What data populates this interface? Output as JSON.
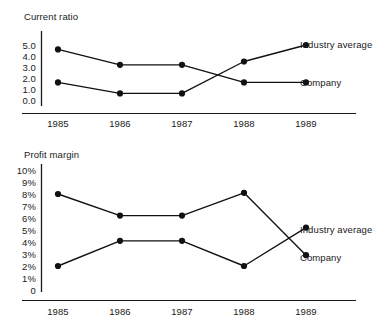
{
  "chart_data": [
    {
      "type": "line",
      "title": "Current ratio",
      "xlabel": "",
      "ylabel": "",
      "categories": [
        "1985",
        "1986",
        "1987",
        "1988",
        "1989"
      ],
      "yticks": [
        "5.0",
        "4.0",
        "3.0",
        "2.0",
        "1.0",
        "0.0"
      ],
      "ylim": [
        0,
        5.6
      ],
      "grid": false,
      "legend_position": "right-inline",
      "series": [
        {
          "name": "Industry average",
          "values": [
            1.6,
            0.6,
            0.6,
            3.5,
            5.0
          ],
          "end_label": "Industry average"
        },
        {
          "name": "Company",
          "values": [
            4.6,
            3.2,
            3.2,
            1.6,
            1.6
          ],
          "end_label": "Company"
        }
      ],
      "annotations": [
        "Series cross between 1987 and 1988"
      ]
    },
    {
      "type": "line",
      "title": "Profit margin",
      "xlabel": "",
      "ylabel": "",
      "categories": [
        "1985",
        "1986",
        "1987",
        "1988",
        "1989"
      ],
      "yticks": [
        "10%",
        "9%",
        "8%",
        "7%",
        "6%",
        "5%",
        "4%",
        "3%",
        "2%",
        "1%",
        "0"
      ],
      "ylim": [
        0,
        10
      ],
      "grid": false,
      "legend_position": "right-inline",
      "series": [
        {
          "name": "Industry average",
          "values": [
            2.0,
            4.1,
            4.1,
            2.0,
            5.2
          ],
          "end_label": "Industry average"
        },
        {
          "name": "Company",
          "values": [
            8.0,
            6.2,
            6.2,
            8.1,
            2.9
          ],
          "end_label": "Company"
        }
      ],
      "annotations": [
        "Series cross between 1988 and 1989"
      ]
    }
  ],
  "charts": {
    "current_ratio": {
      "title": "Current ratio",
      "yticks": [
        "5.0",
        "4.0",
        "3.0",
        "2.0",
        "1.0",
        "0.0"
      ],
      "xticks": [
        "1985",
        "1986",
        "1987",
        "1988",
        "1989"
      ],
      "labels": {
        "industry": "Industry average",
        "company": "Company"
      }
    },
    "profit_margin": {
      "title": "Profit margin",
      "yticks": [
        "10%",
        "9%",
        "8%",
        "7%",
        "6%",
        "5%",
        "4%",
        "3%",
        "2%",
        "1%",
        "0"
      ],
      "xticks": [
        "1985",
        "1986",
        "1987",
        "1988",
        "1989"
      ],
      "labels": {
        "industry": "Industry average",
        "company": "Company"
      }
    }
  },
  "colors": {
    "ink": "#111111",
    "background": "#ffffff"
  }
}
